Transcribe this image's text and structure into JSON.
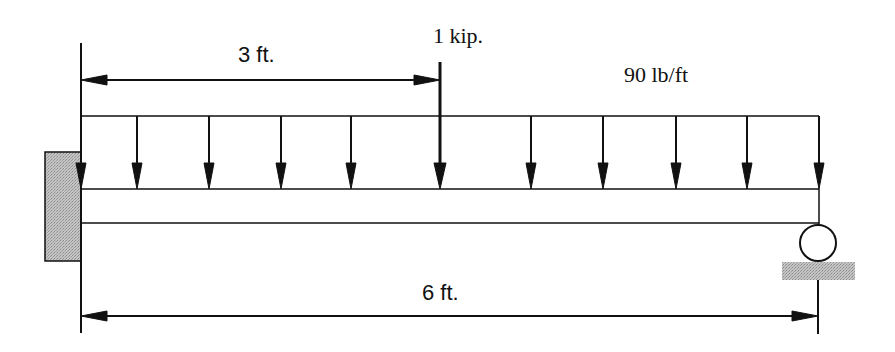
{
  "diagram": {
    "type": "beam-loading",
    "labels": {
      "left_dimension": "3 ft.",
      "point_load": "1 kip.",
      "distributed_load": "90 lb/ft",
      "span_dimension": "6 ft."
    },
    "supports": {
      "left": "fixed-wall",
      "right": "roller"
    },
    "colors": {
      "line": "#111111",
      "support_fill": "#b8b8b8"
    }
  }
}
